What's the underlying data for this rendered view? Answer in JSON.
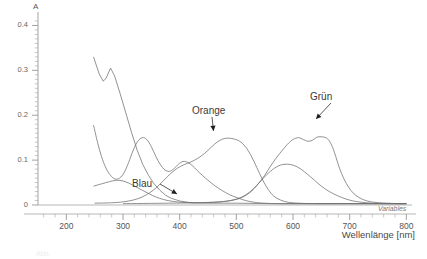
{
  "figure": {
    "caption": "Abb.",
    "variables_label": "Variables"
  },
  "chart_data": {
    "type": "line",
    "title": "",
    "xlabel": "Wellenlänge [nm]",
    "ylabel": "A",
    "xlim": [
      150,
      810
    ],
    "ylim": [
      0,
      0.43
    ],
    "xticks": [
      200,
      300,
      400,
      500,
      600,
      700,
      800
    ],
    "yticks": [
      0,
      0.1,
      0.2,
      0.3,
      0.4
    ],
    "ytick_labels": [
      "0",
      "0.1",
      "0.2",
      "0.3",
      "0.4"
    ],
    "xtick_labels": [
      "200",
      "300",
      "400",
      "500",
      "600",
      "700",
      "800"
    ],
    "grid": false,
    "legend": "annotations",
    "minor_ticks": true,
    "annotations": [
      {
        "text": "Orange",
        "x": 485,
        "y": 0.148,
        "label_x": 470,
        "label_y": 0.205
      },
      {
        "text": "Grün",
        "x": 645,
        "y": 0.152,
        "label_x": 660,
        "label_y": 0.232
      },
      {
        "text": "Blau",
        "x": 450,
        "y": 0.006,
        "label_x": 405,
        "label_y": 0.042
      }
    ],
    "series": [
      {
        "name": "steep-uv-decay",
        "points": [
          [
            248,
            0.33
          ],
          [
            258,
            0.292
          ],
          [
            265,
            0.276
          ],
          [
            270,
            0.282
          ],
          [
            278,
            0.305
          ],
          [
            285,
            0.288
          ],
          [
            295,
            0.248
          ],
          [
            305,
            0.205
          ],
          [
            315,
            0.162
          ],
          [
            325,
            0.122
          ],
          [
            335,
            0.09
          ],
          [
            345,
            0.066
          ],
          [
            355,
            0.047
          ],
          [
            365,
            0.033
          ],
          [
            375,
            0.022
          ],
          [
            385,
            0.015
          ],
          [
            400,
            0.009
          ],
          [
            420,
            0.005
          ],
          [
            450,
            0.004
          ],
          [
            500,
            0.004
          ],
          [
            560,
            0.003
          ],
          [
            620,
            0.003
          ],
          [
            700,
            0.003
          ],
          [
            800,
            0.003
          ]
        ]
      },
      {
        "name": "violet-double-peak",
        "points": [
          [
            248,
            0.178
          ],
          [
            255,
            0.14
          ],
          [
            262,
            0.108
          ],
          [
            270,
            0.082
          ],
          [
            278,
            0.066
          ],
          [
            286,
            0.058
          ],
          [
            294,
            0.06
          ],
          [
            302,
            0.072
          ],
          [
            310,
            0.095
          ],
          [
            318,
            0.122
          ],
          [
            326,
            0.142
          ],
          [
            334,
            0.15
          ],
          [
            342,
            0.146
          ],
          [
            350,
            0.13
          ],
          [
            358,
            0.108
          ],
          [
            366,
            0.09
          ],
          [
            374,
            0.078
          ],
          [
            382,
            0.075
          ],
          [
            390,
            0.081
          ],
          [
            398,
            0.091
          ],
          [
            406,
            0.097
          ],
          [
            414,
            0.095
          ],
          [
            422,
            0.088
          ],
          [
            430,
            0.078
          ],
          [
            440,
            0.066
          ],
          [
            450,
            0.055
          ],
          [
            462,
            0.043
          ],
          [
            474,
            0.033
          ],
          [
            488,
            0.023
          ],
          [
            502,
            0.016
          ],
          [
            516,
            0.01
          ],
          [
            532,
            0.006
          ],
          [
            550,
            0.004
          ],
          [
            580,
            0.003
          ],
          [
            650,
            0.003
          ],
          [
            800,
            0.003
          ]
        ]
      },
      {
        "name": "orange",
        "points": [
          [
            248,
            0.042
          ],
          [
            262,
            0.047
          ],
          [
            276,
            0.052
          ],
          [
            288,
            0.055
          ],
          [
            298,
            0.054
          ],
          [
            310,
            0.049
          ],
          [
            322,
            0.041
          ],
          [
            334,
            0.033
          ],
          [
            346,
            0.025
          ],
          [
            358,
            0.018
          ],
          [
            372,
            0.012
          ],
          [
            388,
            0.008
          ],
          [
            404,
            0.006
          ],
          [
            420,
            0.005
          ],
          [
            440,
            0.005
          ],
          [
            460,
            0.006
          ],
          [
            480,
            0.008
          ],
          [
            500,
            0.013
          ],
          [
            516,
            0.022
          ],
          [
            530,
            0.036
          ],
          [
            542,
            0.052
          ],
          [
            554,
            0.068
          ],
          [
            566,
            0.081
          ],
          [
            578,
            0.089
          ],
          [
            590,
            0.091
          ],
          [
            602,
            0.088
          ],
          [
            614,
            0.08
          ],
          [
            626,
            0.068
          ],
          [
            638,
            0.055
          ],
          [
            650,
            0.042
          ],
          [
            664,
            0.03
          ],
          [
            678,
            0.021
          ],
          [
            692,
            0.014
          ],
          [
            706,
            0.009
          ],
          [
            722,
            0.006
          ],
          [
            740,
            0.004
          ],
          [
            760,
            0.003
          ],
          [
            800,
            0.003
          ]
        ]
      },
      {
        "name": "mid-band-485",
        "points": [
          [
            250,
            0.004
          ],
          [
            280,
            0.005
          ],
          [
            300,
            0.007
          ],
          [
            318,
            0.011
          ],
          [
            334,
            0.018
          ],
          [
            348,
            0.028
          ],
          [
            360,
            0.04
          ],
          [
            372,
            0.055
          ],
          [
            384,
            0.07
          ],
          [
            396,
            0.082
          ],
          [
            408,
            0.09
          ],
          [
            420,
            0.096
          ],
          [
            432,
            0.104
          ],
          [
            444,
            0.115
          ],
          [
            456,
            0.129
          ],
          [
            466,
            0.14
          ],
          [
            476,
            0.147
          ],
          [
            486,
            0.149
          ],
          [
            496,
            0.147
          ],
          [
            506,
            0.142
          ],
          [
            516,
            0.13
          ],
          [
            526,
            0.11
          ],
          [
            536,
            0.084
          ],
          [
            546,
            0.057
          ],
          [
            556,
            0.035
          ],
          [
            566,
            0.02
          ],
          [
            578,
            0.011
          ],
          [
            592,
            0.006
          ],
          [
            610,
            0.004
          ],
          [
            640,
            0.003
          ],
          [
            700,
            0.003
          ],
          [
            800,
            0.003
          ]
        ]
      },
      {
        "name": "gruen",
        "points": [
          [
            300,
            0.003
          ],
          [
            380,
            0.004
          ],
          [
            430,
            0.005
          ],
          [
            470,
            0.007
          ],
          [
            495,
            0.011
          ],
          [
            512,
            0.018
          ],
          [
            526,
            0.03
          ],
          [
            538,
            0.046
          ],
          [
            550,
            0.066
          ],
          [
            560,
            0.086
          ],
          [
            570,
            0.104
          ],
          [
            580,
            0.12
          ],
          [
            590,
            0.135
          ],
          [
            600,
            0.146
          ],
          [
            610,
            0.15
          ],
          [
            618,
            0.146
          ],
          [
            626,
            0.142
          ],
          [
            634,
            0.144
          ],
          [
            642,
            0.151
          ],
          [
            650,
            0.152
          ],
          [
            658,
            0.15
          ],
          [
            664,
            0.143
          ],
          [
            670,
            0.128
          ],
          [
            676,
            0.106
          ],
          [
            682,
            0.082
          ],
          [
            690,
            0.058
          ],
          [
            698,
            0.04
          ],
          [
            706,
            0.027
          ],
          [
            716,
            0.017
          ],
          [
            726,
            0.011
          ],
          [
            738,
            0.007
          ],
          [
            752,
            0.005
          ],
          [
            768,
            0.004
          ],
          [
            785,
            0.003
          ],
          [
            800,
            0.003
          ]
        ]
      }
    ]
  }
}
